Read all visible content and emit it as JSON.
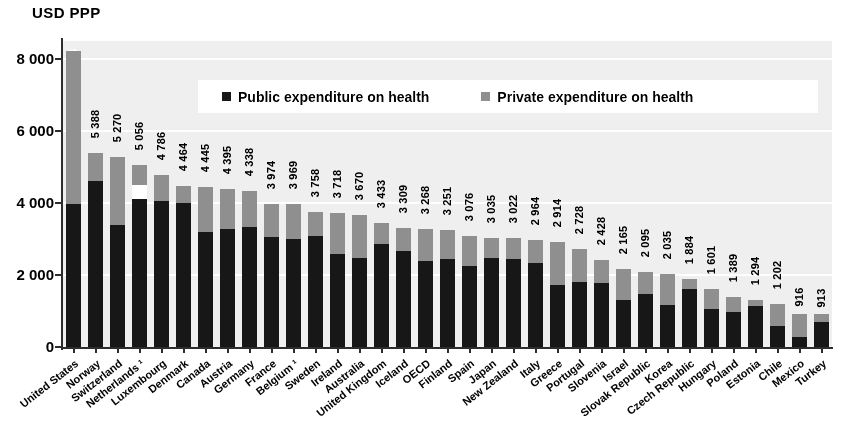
{
  "axis_unit_label": "USD PPP",
  "legend": {
    "public": {
      "label": "Public expenditure on health",
      "color": "#272727",
      "swatch": "square-marker-icon"
    },
    "private": {
      "label": "Private expenditure on health",
      "color": "#8d8d8d",
      "swatch": "square-marker-icon"
    }
  },
  "y_axis": {
    "ticks": [
      "0",
      "2 000",
      "4 000",
      "6 000",
      "8 000"
    ],
    "tick_values": [
      0,
      2000,
      4000,
      6000,
      8000
    ],
    "min": 0,
    "max": 8500
  },
  "chart_data": {
    "type": "bar",
    "subtype": "stacked-vertical",
    "title": "",
    "subtitle": "",
    "xlabel": "",
    "ylabel": "USD PPP",
    "ylim": [
      0,
      8500
    ],
    "grid": true,
    "legend_position": "top-center-inside",
    "categories": [
      "United States",
      "Norway",
      "Switzerland",
      "Netherlands ¹",
      "Luxembourg",
      "Denmark",
      "Canada",
      "Austria",
      "Germany",
      "France",
      "Belgium ¹",
      "Sweden",
      "Ireland",
      "Australia",
      "United Kingdom",
      "Iceland",
      "OECD",
      "Finland",
      "Spain",
      "Japan",
      "New Zealand",
      "Italy",
      "Greece",
      "Portugal",
      "Slovenia",
      "Israel",
      "Slovak Republic",
      "Korea",
      "Czech Republic",
      "Hungary",
      "Poland",
      "Estonia",
      "Chile",
      "Mexico",
      "Turkey"
    ],
    "totals": [
      8233,
      5388,
      5270,
      5056,
      4786,
      4464,
      4445,
      4395,
      4338,
      3974,
      3969,
      3758,
      3718,
      3670,
      3433,
      3309,
      3268,
      3251,
      3076,
      3035,
      3022,
      2964,
      2914,
      2728,
      2428,
      2165,
      2095,
      2035,
      1884,
      1601,
      1389,
      1294,
      1202,
      916,
      913
    ],
    "total_labels": [
      "8 233",
      "5 388",
      "5 270",
      "5 056",
      "4 786",
      "4 464",
      "4 445",
      "4 395",
      "4 338",
      "3 974",
      "3 969",
      "3 758",
      "3 718",
      "3 670",
      "3 433",
      "3 309",
      "3 268",
      "3 251",
      "3 076",
      "3 035",
      "3 022",
      "2 964",
      "2 914",
      "2 728",
      "2 428",
      "2 165",
      "2 095",
      "2 035",
      "1 884",
      "1 601",
      "1 389",
      "1 294",
      "1 202",
      "916",
      "913"
    ],
    "series": [
      {
        "name": "Public expenditure on health",
        "color": "#272727",
        "values": [
          3967,
          4600,
          3377,
          4105,
          4067,
          3996,
          3186,
          3290,
          3331,
          3061,
          2993,
          3079,
          2581,
          2475,
          2857,
          2657,
          2379,
          2437,
          2259,
          2473,
          2458,
          2331,
          1714,
          1794,
          1767,
          1310,
          1460,
          1166,
          1607,
          1062,
          977,
          1145,
          571,
          282,
          683
        ]
      },
      {
        "name": "Private expenditure on health",
        "color": "#8d8d8d",
        "values": [
          4266,
          788,
          1893,
          951,
          719,
          468,
          1259,
          1105,
          1007,
          913,
          976,
          679,
          1137,
          1195,
          576,
          652,
          889,
          814,
          817,
          562,
          564,
          633,
          1200,
          934,
          661,
          855,
          635,
          869,
          277,
          539,
          412,
          149,
          631,
          634,
          230
        ]
      }
    ]
  }
}
